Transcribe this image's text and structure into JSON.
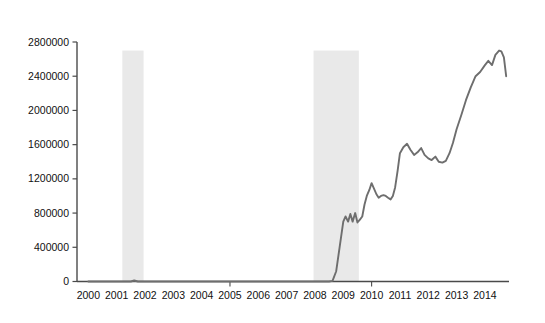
{
  "figure": {
    "background_color": "#ffffff",
    "width": 545,
    "height": 323
  },
  "chart_data": {
    "type": "line",
    "title": "",
    "subtitle": "",
    "xlabel": "",
    "ylabel": "",
    "xlim": [
      1999.6,
      2014.85
    ],
    "ylim": [
      0,
      2800000
    ],
    "grid": false,
    "legend": null,
    "line_color": "#6e6e6e",
    "shaded_region_color": "#e9e9e9",
    "axis_color": "#4a4a4a",
    "ytick_labels": [
      "0",
      "400000",
      "800000",
      "1200000",
      "1600000",
      "2000000",
      "2400000",
      "2800000"
    ],
    "ytick_values": [
      0,
      400000,
      800000,
      1200000,
      1600000,
      2000000,
      2400000,
      2800000
    ],
    "xtick_labels": [
      "2000",
      "2001",
      "2002",
      "2003",
      "2004",
      "2005",
      "2006",
      "2007",
      "2008",
      "2009",
      "2010",
      "2011",
      "2012",
      "2013",
      "2014"
    ],
    "xtick_values": [
      2000,
      2001,
      2002,
      2003,
      2004,
      2005,
      2006,
      2007,
      2008,
      2009,
      2010,
      2011,
      2012,
      2013,
      2014
    ],
    "xtick_major": [
      2005,
      2010
    ],
    "shaded_regions": [
      {
        "name": "recession-band-2001",
        "x_start": 2001.2,
        "x_end": 2001.95,
        "y_top": 2700000
      },
      {
        "name": "recession-band-2008",
        "x_start": 2007.95,
        "x_end": 2009.55,
        "y_top": 2700000
      }
    ],
    "series": [
      {
        "name": "series-1",
        "color": "#6e6e6e",
        "x": [
          2000.0,
          2000.25,
          2000.5,
          2000.75,
          2001.0,
          2001.25,
          2001.5,
          2001.62,
          2001.75,
          2002.0,
          2002.25,
          2002.5,
          2002.75,
          2003.0,
          2003.25,
          2003.5,
          2003.75,
          2004.0,
          2004.25,
          2004.5,
          2004.75,
          2005.0,
          2005.25,
          2005.5,
          2005.75,
          2006.0,
          2006.25,
          2006.5,
          2006.75,
          2007.0,
          2007.25,
          2007.5,
          2007.75,
          2008.0,
          2008.25,
          2008.5,
          2008.62,
          2008.75,
          2008.87,
          2009.0,
          2009.08,
          2009.17,
          2009.25,
          2009.33,
          2009.42,
          2009.5,
          2009.58,
          2009.67,
          2009.75,
          2009.83,
          2009.92,
          2010.0,
          2010.08,
          2010.17,
          2010.25,
          2010.33,
          2010.42,
          2010.5,
          2010.58,
          2010.67,
          2010.75,
          2010.83,
          2010.92,
          2011.0,
          2011.12,
          2011.25,
          2011.37,
          2011.5,
          2011.62,
          2011.75,
          2011.87,
          2012.0,
          2012.12,
          2012.25,
          2012.37,
          2012.5,
          2012.62,
          2012.75,
          2012.87,
          2013.0,
          2013.17,
          2013.33,
          2013.5,
          2013.67,
          2013.83,
          2014.0,
          2014.12,
          2014.25,
          2014.37,
          2014.5,
          2014.58,
          2014.67,
          2014.75
        ],
        "y": [
          0,
          0,
          0,
          0,
          0,
          0,
          0,
          12000,
          0,
          0,
          0,
          0,
          0,
          0,
          0,
          0,
          0,
          0,
          0,
          0,
          0,
          0,
          0,
          0,
          0,
          0,
          0,
          0,
          0,
          0,
          0,
          0,
          0,
          0,
          0,
          0,
          8000,
          120000,
          400000,
          700000,
          760000,
          700000,
          790000,
          700000,
          800000,
          690000,
          720000,
          760000,
          900000,
          1000000,
          1070000,
          1150000,
          1090000,
          1020000,
          980000,
          1000000,
          1010000,
          1000000,
          980000,
          960000,
          1000000,
          1100000,
          1300000,
          1500000,
          1570000,
          1610000,
          1540000,
          1480000,
          1510000,
          1560000,
          1480000,
          1440000,
          1420000,
          1460000,
          1400000,
          1390000,
          1410000,
          1500000,
          1620000,
          1780000,
          1950000,
          2120000,
          2270000,
          2400000,
          2450000,
          2530000,
          2580000,
          2530000,
          2650000,
          2700000,
          2690000,
          2620000,
          2400000
        ]
      }
    ]
  }
}
